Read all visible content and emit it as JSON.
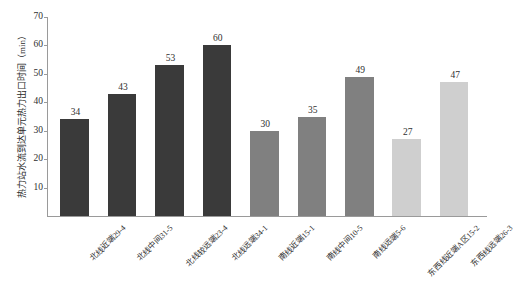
{
  "chart_data": {
    "type": "bar",
    "title": "",
    "xlabel": "",
    "ylabel": "热力站水流到达单元热力出口时间（min）",
    "ylim": [
      0,
      70
    ],
    "ytick_labels": [
      "10",
      "20",
      "30",
      "40",
      "50",
      "60",
      "70"
    ],
    "ytick_values": [
      10,
      20,
      30,
      40,
      50,
      60,
      70
    ],
    "grid": false,
    "legend": "none",
    "categories": [
      "北线近端29-4",
      "北线中间31-5",
      "北线较远端23-4",
      "北线远端34-1",
      "南线近端15-1",
      "南线中间10-5",
      "南线远端5-6",
      "东西线近端A区15-2",
      "东西线远端26-3"
    ],
    "values": [
      34,
      43,
      53,
      60,
      30,
      35,
      49,
      27,
      47
    ],
    "value_labels": [
      "34",
      "43",
      "53",
      "60",
      "30",
      "35",
      "49",
      "27",
      "47"
    ],
    "bar_colors": [
      "#3a3a3a",
      "#3a3a3a",
      "#3a3a3a",
      "#3a3a3a",
      "#808080",
      "#808080",
      "#808080",
      "#cfcfcf",
      "#cfcfcf"
    ],
    "groups": [
      {
        "name": "北线",
        "color": "#3a3a3a",
        "count": 4
      },
      {
        "name": "南线",
        "color": "#808080",
        "count": 3
      },
      {
        "name": "东西线",
        "color": "#cfcfcf",
        "count": 2
      }
    ],
    "axis_color": "#9a9a9a",
    "background": "#ffffff"
  }
}
